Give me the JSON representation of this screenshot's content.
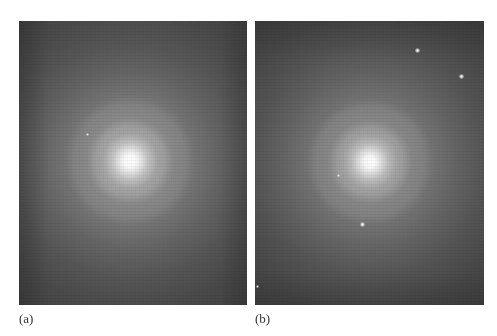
{
  "figure": {
    "panels": [
      {
        "id": "a",
        "label": "(a)",
        "content": "galaxy-image",
        "stars": [
          {
            "x": 68,
            "y": 113,
            "size": "small"
          }
        ]
      },
      {
        "id": "b",
        "label": "(b)",
        "content": "galaxy-image",
        "stars": [
          {
            "x": 162,
            "y": 29,
            "size": "normal"
          },
          {
            "x": 206,
            "y": 55,
            "size": "normal"
          },
          {
            "x": 83,
            "y": 154,
            "size": "small"
          },
          {
            "x": 107,
            "y": 203,
            "size": "normal"
          },
          {
            "x": 2,
            "y": 265,
            "size": "small"
          }
        ]
      }
    ],
    "colors": {
      "background": "#ffffff",
      "sky": "#3a3a3a",
      "core": "#ffffff",
      "label_text": "#333333"
    }
  }
}
